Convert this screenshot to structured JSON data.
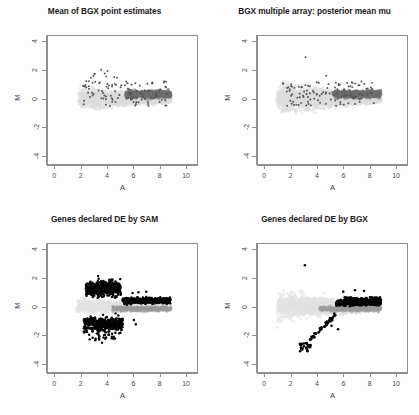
{
  "figure": {
    "layout": "2x2 grid of MA scatter plots",
    "background_color": "#fdfdfd"
  },
  "chart_data": [
    {
      "type": "scatter",
      "title": "Mean of BGX point estimates",
      "xlabel": "A",
      "ylabel": "M",
      "xlim": [
        -0.55,
        10.9
      ],
      "ylim": [
        -4.6,
        4.4
      ],
      "xticks": [
        0,
        2,
        4,
        6,
        8,
        10
      ],
      "yticks": [
        -4,
        -2,
        0,
        2,
        4
      ],
      "grid": false,
      "legend": "none",
      "series": [
        {
          "name": "all genes",
          "color": "#dcdcdc",
          "marker": "circle",
          "description": "large pale cloud spanning A 1.8 to 8.9, M centred near 0",
          "n_points": 2200
        },
        {
          "name": "high-intensity genes",
          "color": "#6e6e6e",
          "marker": "circle",
          "description": "dark grey dense band from A 5.5 to 8.9 around M 0.3",
          "n_points": 700
        },
        {
          "name": "spike-in / highlighted genes",
          "color": "#555555",
          "marker": "dot",
          "description": "scattered dark dots across A 2 to 8.5",
          "n_points": 120
        }
      ]
    },
    {
      "type": "scatter",
      "title": "BGX multiple array: posterior mean mu",
      "xlabel": "A",
      "ylabel": "M",
      "xlim": [
        -0.55,
        10.9
      ],
      "ylim": [
        -4.6,
        4.4
      ],
      "xticks": [
        0,
        2,
        4,
        6,
        8,
        10
      ],
      "yticks": [
        -4,
        -2,
        0,
        2,
        4
      ],
      "grid": false,
      "legend": "none",
      "series": [
        {
          "name": "all genes",
          "color": "#dcdcdc",
          "marker": "circle",
          "description": "pale cloud spanning A 0.9 to 8.9, wider at low A, M from -2.6 to 2",
          "n_points": 2400
        },
        {
          "name": "high-intensity genes",
          "color": "#6e6e6e",
          "marker": "circle",
          "description": "dark grey dense band from A 5.3 to 8.9 around M 0.3",
          "n_points": 700
        },
        {
          "name": "spike-in / highlighted genes",
          "color": "#555555",
          "marker": "dot",
          "description": "scattered dark dots across A 1.3 to 8.3, one outlier near A 3.1 M 2.9",
          "n_points": 120
        }
      ]
    },
    {
      "type": "scatter",
      "title": "Genes declared DE by SAM",
      "xlabel": "A",
      "ylabel": "M",
      "xlim": [
        -0.55,
        10.9
      ],
      "ylim": [
        -4.6,
        4.4
      ],
      "xticks": [
        0,
        2,
        4,
        6,
        8,
        10
      ],
      "yticks": [
        -4,
        -2,
        0,
        2,
        4
      ],
      "grid": false,
      "legend": "none",
      "series": [
        {
          "name": "non-DE genes",
          "color": "#e0e0e0",
          "marker": "circle",
          "description": "pale cloud near M 0 spanning A 1.6 to 8.9",
          "n_points": 1600
        },
        {
          "name": "mid-intensity band",
          "color": "#9a9a9a",
          "marker": "circle",
          "description": "grey band from A 4.5 to 8.9 just below M 0",
          "n_points": 500
        },
        {
          "name": "declared DE by SAM",
          "color": "#050505",
          "marker": "dot",
          "description": "black points in two lobes: upper lobe A 2.4-5 M 0.6-2.2 merging into dense band A 5.5-8.9 M 0.4; lower lobe A 2.2-5.2 M -0.6 to -2.6",
          "n_points": 1300
        }
      ]
    },
    {
      "type": "scatter",
      "title": "Genes declared DE by BGX",
      "xlabel": "A",
      "ylabel": "M",
      "xlim": [
        -0.55,
        10.9
      ],
      "ylim": [
        -4.6,
        4.4
      ],
      "xticks": [
        0,
        2,
        4,
        6,
        8,
        10
      ],
      "yticks": [
        -4,
        -2,
        0,
        2,
        4
      ],
      "grid": false,
      "legend": "none",
      "series": [
        {
          "name": "non-DE genes",
          "color": "#e0e0e0",
          "marker": "circle",
          "description": "pale cloud spanning A 0.9 to 8.9 centred on M 0",
          "n_points": 2100
        },
        {
          "name": "mid-intensity band",
          "color": "#9a9a9a",
          "marker": "circle",
          "description": "grey band from A 4.3 to 8.9 just below M 0",
          "n_points": 450
        },
        {
          "name": "declared DE by BGX",
          "color": "#050505",
          "marker": "dot",
          "description": "dense black blob A 6.1-8.9 at M 0.3 plus diagonal tail running down-left from A 5.5 M -0.5 to A 2.7 M -3.1",
          "n_points": 800
        }
      ]
    }
  ]
}
